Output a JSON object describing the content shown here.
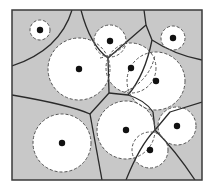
{
  "diagram": {
    "type": "power-diagram",
    "colors": {
      "background": "#ffffff",
      "cell_fill": "#c8c8c8",
      "circle_fill": "#ffffff",
      "edge": "#2a2a2a",
      "border": "#3a3a3a",
      "dashed": "#555555",
      "site": "#111111"
    },
    "frame": {
      "x": 12,
      "y": 10,
      "width": 190,
      "height": 170
    },
    "circles": [
      {
        "id": "A",
        "cx": 40,
        "cy": 30,
        "r": 10
      },
      {
        "id": "B",
        "cx": 79,
        "cy": 69,
        "r": 31
      },
      {
        "id": "C",
        "cx": 110,
        "cy": 41,
        "r": 16
      },
      {
        "id": "D",
        "cx": 173,
        "cy": 38,
        "r": 12
      },
      {
        "id": "E",
        "cx": 131,
        "cy": 68,
        "r": 25
      },
      {
        "id": "F",
        "cx": 156,
        "cy": 81,
        "r": 29
      },
      {
        "id": "G",
        "cx": 62,
        "cy": 143,
        "r": 29
      },
      {
        "id": "H",
        "cx": 126,
        "cy": 130,
        "r": 29
      },
      {
        "id": "I",
        "cx": 177,
        "cy": 126,
        "r": 19
      },
      {
        "id": "J",
        "cx": 150,
        "cy": 150,
        "r": 18
      }
    ],
    "edges": [
      {
        "id": "e1",
        "d": "M72,10 Q60,50 12,66"
      },
      {
        "id": "e2",
        "d": "M81,10 Q90,45 108,58"
      },
      {
        "id": "e3",
        "d": "M108,58 L109,93"
      },
      {
        "id": "e4",
        "d": "M144,10 L146,25 L108,58"
      },
      {
        "id": "e5",
        "d": "M146,25 L152,40 Q175,55 202,60"
      },
      {
        "id": "e6",
        "d": "M152,40 Q145,75 128,95"
      },
      {
        "id": "e7",
        "d": "M12,95 Q70,105 90,114 L109,93"
      },
      {
        "id": "e8",
        "d": "M90,114 L102,180"
      },
      {
        "id": "e9",
        "d": "M109,93 L128,95 Q145,100 153,112 L155,130"
      },
      {
        "id": "e10",
        "d": "M155,130 L170,112 L202,102"
      },
      {
        "id": "e11",
        "d": "M155,130 Q140,145 126,180"
      },
      {
        "id": "e12",
        "d": "M155,130 Q175,150 195,180"
      }
    ],
    "dashed_chords": [
      {
        "id": "d1",
        "d": "M100,58 Q115,55 125,45"
      },
      {
        "id": "d2",
        "d": "M125,92 Q150,80 155,55"
      }
    ]
  }
}
